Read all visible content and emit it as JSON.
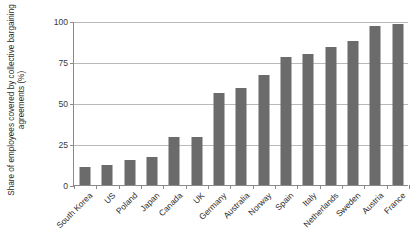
{
  "chart_data": {
    "type": "bar",
    "title": "",
    "xlabel": "",
    "ylabel": "Share of employees covered by collective bargaining agreements (%)",
    "ylim": [
      0,
      100
    ],
    "yticks": [
      0,
      25,
      50,
      75,
      100
    ],
    "ytick_labels": [
      "0",
      "25",
      "50",
      "75",
      "100"
    ],
    "grid": "horizontal",
    "legend": "none",
    "bar_color": "#6b6b6b",
    "categories": [
      "South Korea",
      "US",
      "Poland",
      "Japan",
      "Canada",
      "UK",
      "Germany",
      "Australia",
      "Norway",
      "Spain",
      "Italy",
      "Netherlands",
      "Sweden",
      "Austria",
      "France"
    ],
    "values": [
      11,
      12,
      15,
      17,
      29,
      29,
      56,
      59,
      67,
      78,
      80,
      84,
      88,
      97,
      98
    ]
  }
}
